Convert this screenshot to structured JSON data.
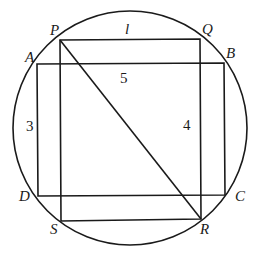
{
  "diagram": {
    "points": {
      "P": "P",
      "Q": "Q",
      "R": "R",
      "S": "S",
      "A": "A",
      "B": "B",
      "C": "C",
      "D": "D"
    },
    "labels": {
      "top_side": "l",
      "ab_side": "5",
      "ad_side": "3",
      "qr_side": "4"
    }
  }
}
